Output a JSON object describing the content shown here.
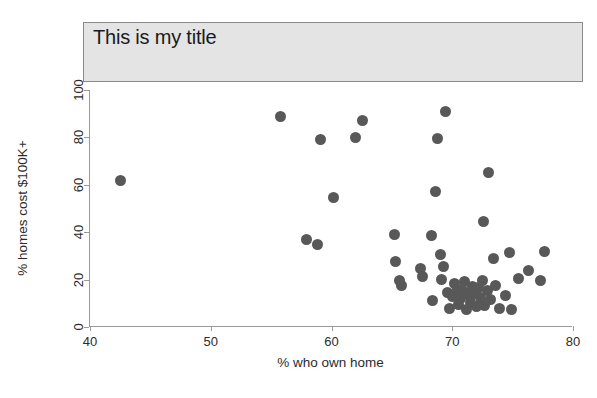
{
  "chart_data": {
    "type": "scatter",
    "title": "This is my title",
    "xlabel": "% who own home",
    "ylabel": "% homes cost $100K+",
    "xlim": [
      40,
      80
    ],
    "ylim": [
      0,
      100
    ],
    "xticks": [
      40,
      50,
      60,
      70,
      80
    ],
    "yticks": [
      0,
      20,
      40,
      60,
      80,
      100
    ],
    "grid": false,
    "legend": null,
    "marker_color": "#585858",
    "title_box_color": "#e4e4e4",
    "points": [
      {
        "x": 42.5,
        "y": 62.0
      },
      {
        "x": 55.8,
        "y": 89.0
      },
      {
        "x": 57.9,
        "y": 37.0
      },
      {
        "x": 58.8,
        "y": 35.0
      },
      {
        "x": 59.1,
        "y": 79.0
      },
      {
        "x": 60.2,
        "y": 54.5
      },
      {
        "x": 62.0,
        "y": 80.0
      },
      {
        "x": 62.6,
        "y": 87.0
      },
      {
        "x": 65.2,
        "y": 39.0
      },
      {
        "x": 65.3,
        "y": 27.5
      },
      {
        "x": 65.6,
        "y": 19.5
      },
      {
        "x": 65.8,
        "y": 17.5
      },
      {
        "x": 67.4,
        "y": 24.5
      },
      {
        "x": 67.5,
        "y": 21.5
      },
      {
        "x": 68.3,
        "y": 38.5
      },
      {
        "x": 68.4,
        "y": 11.0
      },
      {
        "x": 68.6,
        "y": 57.0
      },
      {
        "x": 68.8,
        "y": 79.5
      },
      {
        "x": 69.0,
        "y": 30.5
      },
      {
        "x": 69.1,
        "y": 20.0
      },
      {
        "x": 69.3,
        "y": 25.5
      },
      {
        "x": 69.4,
        "y": 91.0
      },
      {
        "x": 69.6,
        "y": 14.5
      },
      {
        "x": 69.8,
        "y": 8.0
      },
      {
        "x": 70.0,
        "y": 13.0
      },
      {
        "x": 70.2,
        "y": 18.5
      },
      {
        "x": 70.4,
        "y": 16.0
      },
      {
        "x": 70.5,
        "y": 9.5
      },
      {
        "x": 70.7,
        "y": 12.0
      },
      {
        "x": 70.9,
        "y": 15.0
      },
      {
        "x": 71.0,
        "y": 19.0
      },
      {
        "x": 71.2,
        "y": 7.5
      },
      {
        "x": 71.4,
        "y": 13.5
      },
      {
        "x": 71.5,
        "y": 10.5
      },
      {
        "x": 71.7,
        "y": 17.0
      },
      {
        "x": 71.9,
        "y": 14.0
      },
      {
        "x": 72.0,
        "y": 8.5
      },
      {
        "x": 72.2,
        "y": 16.5
      },
      {
        "x": 72.3,
        "y": 12.5
      },
      {
        "x": 72.5,
        "y": 19.5
      },
      {
        "x": 72.6,
        "y": 44.5
      },
      {
        "x": 72.7,
        "y": 9.0
      },
      {
        "x": 72.9,
        "y": 15.5
      },
      {
        "x": 73.0,
        "y": 65.0
      },
      {
        "x": 73.2,
        "y": 11.5
      },
      {
        "x": 73.4,
        "y": 29.0
      },
      {
        "x": 73.6,
        "y": 17.5
      },
      {
        "x": 73.9,
        "y": 8.0
      },
      {
        "x": 74.4,
        "y": 13.5
      },
      {
        "x": 74.7,
        "y": 31.5
      },
      {
        "x": 74.9,
        "y": 7.5
      },
      {
        "x": 76.3,
        "y": 24.0
      },
      {
        "x": 77.3,
        "y": 19.5
      },
      {
        "x": 77.6,
        "y": 32.0
      },
      {
        "x": 75.5,
        "y": 20.5
      }
    ]
  }
}
